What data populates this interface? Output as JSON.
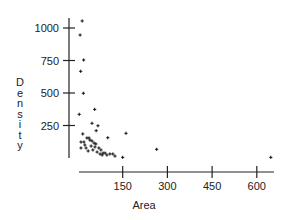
{
  "chart_data": {
    "type": "scatter",
    "title": "",
    "xlabel": "Area",
    "ylabel": "Density",
    "xlim": [
      0,
      660
    ],
    "ylim": [
      0,
      1080
    ],
    "xticks": [
      150,
      300,
      450,
      600
    ],
    "yticks": [
      250,
      500,
      750,
      1000
    ],
    "grid": false,
    "legend": null,
    "marker": "+",
    "points": [
      {
        "x": 14,
        "y": 1054
      },
      {
        "x": 7,
        "y": 946
      },
      {
        "x": 19,
        "y": 754
      },
      {
        "x": 9,
        "y": 667
      },
      {
        "x": 18,
        "y": 498
      },
      {
        "x": 56,
        "y": 374
      },
      {
        "x": 4,
        "y": 336
      },
      {
        "x": 47,
        "y": 267
      },
      {
        "x": 67,
        "y": 248
      },
      {
        "x": 61,
        "y": 210
      },
      {
        "x": 16,
        "y": 185
      },
      {
        "x": 161,
        "y": 190
      },
      {
        "x": 100,
        "y": 156
      },
      {
        "x": 30,
        "y": 154
      },
      {
        "x": 37,
        "y": 154
      },
      {
        "x": 10,
        "y": 123
      },
      {
        "x": 40,
        "y": 138
      },
      {
        "x": 47,
        "y": 131
      },
      {
        "x": 54,
        "y": 115
      },
      {
        "x": 23,
        "y": 100
      },
      {
        "x": 44,
        "y": 92
      },
      {
        "x": 57,
        "y": 85
      },
      {
        "x": 27,
        "y": 77
      },
      {
        "x": 70,
        "y": 77
      },
      {
        "x": 50,
        "y": 62
      },
      {
        "x": 77,
        "y": 62
      },
      {
        "x": 10,
        "y": 77
      },
      {
        "x": 34,
        "y": 54
      },
      {
        "x": 64,
        "y": 46
      },
      {
        "x": 84,
        "y": 38
      },
      {
        "x": 91,
        "y": 38
      },
      {
        "x": 107,
        "y": 31
      },
      {
        "x": 117,
        "y": 31
      },
      {
        "x": 74,
        "y": 31
      },
      {
        "x": 81,
        "y": 23
      },
      {
        "x": 97,
        "y": 23
      },
      {
        "x": 124,
        "y": 15
      },
      {
        "x": 150,
        "y": 5
      },
      {
        "x": 264,
        "y": 67
      },
      {
        "x": 647,
        "y": 5
      },
      {
        "x": 20,
        "y": 123
      },
      {
        "x": 60,
        "y": 108
      }
    ]
  },
  "labels": {
    "x_axis_title": "Area",
    "y_axis_title": "Density",
    "x_ticks": [
      "150",
      "300",
      "450",
      "600"
    ],
    "y_ticks": [
      "250",
      "500",
      "750",
      "1000"
    ]
  },
  "colors": {
    "axis": "#222222",
    "marker": "#111111",
    "background": "#ffffff"
  }
}
